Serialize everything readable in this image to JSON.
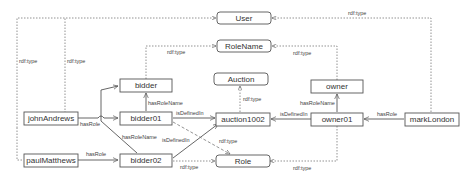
{
  "diagram": {
    "classes": {
      "user": "User",
      "role_name": "RoleName",
      "auction": "Auction",
      "role": "Role"
    },
    "role_names": {
      "bidder": "bidder",
      "owner": "owner"
    },
    "individuals": {
      "john_andrews": "johnAndrews",
      "paul_matthews": "paulMatthews",
      "mark_london": "markLondon",
      "bidder01": "bidder01",
      "bidder02": "bidder02",
      "auction1002": "auction1002",
      "owner01": "owner01"
    },
    "edge_labels": {
      "rdf_type": "rdf:type",
      "has_role": "hasRole",
      "has_role_name": "hasRoleName",
      "is_defined_in": "isDefinedIn"
    },
    "edges": [
      {
        "from": "johnAndrews",
        "to": "User",
        "label": "rdf:type",
        "style": "dotted"
      },
      {
        "from": "paulMatthews",
        "to": "User",
        "label": "rdf:type",
        "style": "dotted"
      },
      {
        "from": "markLondon",
        "to": "User",
        "label": "rdf:type",
        "style": "dotted"
      },
      {
        "from": "bidder",
        "to": "RoleName",
        "label": "rdf:type",
        "style": "dotted"
      },
      {
        "from": "owner",
        "to": "RoleName",
        "label": "rdf:type",
        "style": "dotted"
      },
      {
        "from": "auction1002",
        "to": "Auction",
        "label": "rdf:type",
        "style": "dotted"
      },
      {
        "from": "johnAndrews",
        "to": "bidder01",
        "label": "hasRole",
        "style": "solid"
      },
      {
        "from": "paulMatthews",
        "to": "bidder02",
        "label": "hasRole",
        "style": "solid"
      },
      {
        "from": "markLondon",
        "to": "owner01",
        "label": "hasRole",
        "style": "solid"
      },
      {
        "from": "bidder01",
        "to": "bidder",
        "label": "hasRoleName",
        "style": "solid"
      },
      {
        "from": "bidder02",
        "to": "bidder",
        "label": "hasRoleName",
        "style": "solid"
      },
      {
        "from": "owner01",
        "to": "owner",
        "label": "hasRoleName",
        "style": "solid"
      },
      {
        "from": "bidder01",
        "to": "auction1002",
        "label": "isDefinedIn",
        "style": "solid"
      },
      {
        "from": "bidder02",
        "to": "auction1002",
        "label": "isDefinedIn",
        "style": "solid"
      },
      {
        "from": "owner01",
        "to": "auction1002",
        "label": "isDefinedIn",
        "style": "solid"
      },
      {
        "from": "bidder01",
        "to": "Role",
        "label": "rdf:type",
        "style": "dashed"
      },
      {
        "from": "bidder02",
        "to": "Role",
        "label": "rdf:type",
        "style": "dotted"
      },
      {
        "from": "owner01",
        "to": "Role",
        "label": "rdf:type",
        "style": "dotted"
      }
    ]
  }
}
